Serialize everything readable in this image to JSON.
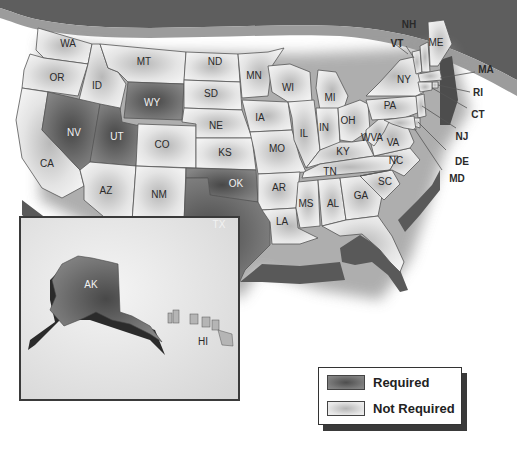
{
  "header": {
    "title_visible": "(partially cropped title)",
    "band_color": "#5e5e5e",
    "band_accent_color": "#9c9c9c"
  },
  "colors": {
    "required": "#6f6f6f",
    "required_center": "#4a4a4a",
    "not_required": "#e8e8e8",
    "not_required_center": "#b8b8b8",
    "border": "#555555",
    "side_wall": "#5a5a5a"
  },
  "legend": {
    "items": [
      {
        "label": "Required",
        "status": "required"
      },
      {
        "label": "Not Required",
        "status": "not_required"
      }
    ]
  },
  "states": [
    {
      "abbr": "WA",
      "status": "not_required"
    },
    {
      "abbr": "OR",
      "status": "not_required"
    },
    {
      "abbr": "CA",
      "status": "not_required"
    },
    {
      "abbr": "ID",
      "status": "not_required"
    },
    {
      "abbr": "NV",
      "status": "required"
    },
    {
      "abbr": "UT",
      "status": "required"
    },
    {
      "abbr": "AZ",
      "status": "not_required"
    },
    {
      "abbr": "MT",
      "status": "not_required"
    },
    {
      "abbr": "WY",
      "status": "required"
    },
    {
      "abbr": "CO",
      "status": "not_required"
    },
    {
      "abbr": "NM",
      "status": "not_required"
    },
    {
      "abbr": "ND",
      "status": "not_required"
    },
    {
      "abbr": "SD",
      "status": "not_required"
    },
    {
      "abbr": "NE",
      "status": "not_required"
    },
    {
      "abbr": "KS",
      "status": "not_required"
    },
    {
      "abbr": "OK",
      "status": "required"
    },
    {
      "abbr": "TX",
      "status": "required"
    },
    {
      "abbr": "MN",
      "status": "not_required"
    },
    {
      "abbr": "IA",
      "status": "not_required"
    },
    {
      "abbr": "MO",
      "status": "not_required"
    },
    {
      "abbr": "AR",
      "status": "not_required"
    },
    {
      "abbr": "LA",
      "status": "not_required"
    },
    {
      "abbr": "WI",
      "status": "not_required"
    },
    {
      "abbr": "IL",
      "status": "not_required"
    },
    {
      "abbr": "MI",
      "status": "not_required"
    },
    {
      "abbr": "IN",
      "status": "not_required"
    },
    {
      "abbr": "OH",
      "status": "not_required"
    },
    {
      "abbr": "KY",
      "status": "not_required"
    },
    {
      "abbr": "TN",
      "status": "not_required"
    },
    {
      "abbr": "MS",
      "status": "not_required"
    },
    {
      "abbr": "AL",
      "status": "not_required"
    },
    {
      "abbr": "GA",
      "status": "not_required"
    },
    {
      "abbr": "FL",
      "status": "not_required"
    },
    {
      "abbr": "SC",
      "status": "not_required"
    },
    {
      "abbr": "NC",
      "status": "not_required"
    },
    {
      "abbr": "VA",
      "status": "not_required"
    },
    {
      "abbr": "WVA",
      "status": "not_required"
    },
    {
      "abbr": "PA",
      "status": "not_required"
    },
    {
      "abbr": "NY",
      "status": "not_required"
    },
    {
      "abbr": "VT",
      "status": "not_required"
    },
    {
      "abbr": "NH",
      "status": "not_required"
    },
    {
      "abbr": "ME",
      "status": "not_required"
    },
    {
      "abbr": "MA",
      "status": "not_required"
    },
    {
      "abbr": "RI",
      "status": "not_required"
    },
    {
      "abbr": "CT",
      "status": "not_required"
    },
    {
      "abbr": "NJ",
      "status": "not_required"
    },
    {
      "abbr": "DE",
      "status": "not_required"
    },
    {
      "abbr": "MD",
      "status": "not_required"
    },
    {
      "abbr": "AK",
      "status": "required"
    },
    {
      "abbr": "HI",
      "status": "not_required"
    }
  ],
  "labels": {
    "WA": "WA",
    "OR": "OR",
    "CA": "CA",
    "ID": "ID",
    "NV": "NV",
    "UT": "UT",
    "AZ": "AZ",
    "MT": "MT",
    "WY": "WY",
    "CO": "CO",
    "NM": "NM",
    "ND": "ND",
    "SD": "SD",
    "NE": "NE",
    "KS": "KS",
    "OK": "OK",
    "TX": "TX",
    "MN": "MN",
    "IA": "IA",
    "MO": "MO",
    "AR": "AR",
    "LA": "LA",
    "WI": "WI",
    "IL": "IL",
    "MI": "MI",
    "IN": "IN",
    "OH": "OH",
    "KY": "KY",
    "TN": "TN",
    "MS": "MS",
    "AL": "AL",
    "GA": "GA",
    "SC": "SC",
    "NC": "NC",
    "VA": "VA",
    "WVA": "WVA",
    "PA": "PA",
    "NY": "NY",
    "VT": "VT",
    "NH": "NH",
    "ME": "ME",
    "MA": "MA",
    "RI": "RI",
    "CT": "CT",
    "NJ": "NJ",
    "DE": "DE",
    "MD": "MD",
    "AK": "AK",
    "HI": "HI"
  }
}
